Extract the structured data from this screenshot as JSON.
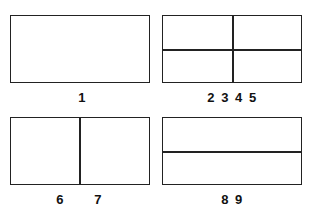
{
  "layouts": [
    {
      "id": "single",
      "label": "1"
    },
    {
      "id": "quad",
      "label": "2 3 4 5"
    },
    {
      "id": "vertical-split",
      "labels": [
        "6",
        "7"
      ]
    },
    {
      "id": "horizontal-split",
      "label": "8 9"
    }
  ]
}
